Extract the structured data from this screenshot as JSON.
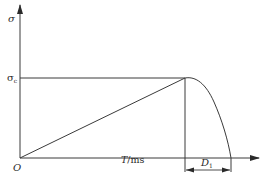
{
  "diagram": {
    "type": "stress-time curve",
    "colors": {
      "line": "#3a3a3a",
      "background": "#ffffff"
    },
    "axes": {
      "y_label": "σ",
      "x_label_var": "T",
      "x_label_unit": "/ms",
      "origin_label": "O"
    },
    "annotations": {
      "peak_label_main": "σ",
      "peak_label_sub": "c",
      "duration_label_main": "D",
      "duration_label_sub": "1"
    },
    "segments": [
      {
        "name": "linear-rise",
        "from": "O",
        "to": "peak (T, σc)"
      },
      {
        "name": "decay",
        "from": "peak (T, σc)",
        "to": "(T + D1, 0)"
      }
    ]
  }
}
